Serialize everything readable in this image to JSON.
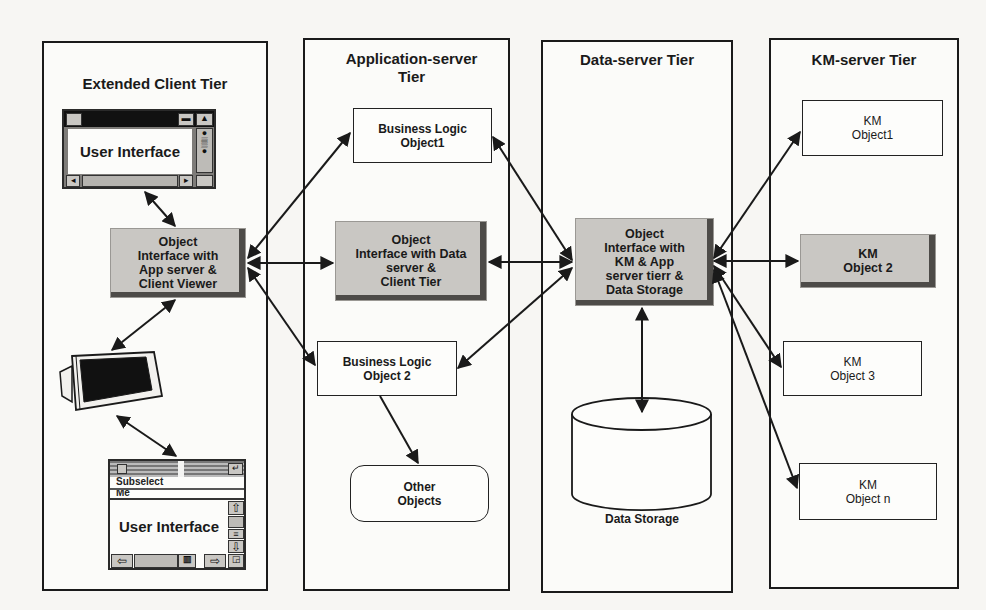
{
  "diagram": {
    "tiers": [
      {
        "id": "client",
        "title": "Extended Client Tier"
      },
      {
        "id": "app",
        "title": "Application-server\nTier"
      },
      {
        "id": "data",
        "title": "Data-server Tier"
      },
      {
        "id": "km",
        "title": "KM-server Tier"
      }
    ],
    "client": {
      "ui_top": {
        "label": "User Interface"
      },
      "object_interface": {
        "label": "Object\nInterface with\nApp server &\nClient Viewer"
      },
      "monitor": {
        "icon": "monitor-icon"
      },
      "ui_bottom": {
        "label": "User Interface",
        "menu_text": "Subselect\nMe"
      }
    },
    "app": {
      "business_logic_1": {
        "label": "Business Logic\nObject1"
      },
      "object_interface": {
        "label": "Object\nInterface with Data\nserver &\nClient Tier"
      },
      "business_logic_2": {
        "label": "Business Logic\nObject 2"
      },
      "other_objects": {
        "label": "Other\nObjects"
      }
    },
    "data": {
      "object_interface": {
        "label": "Object\nInterface with\nKM & App\nserver tierr &\nData Storage"
      },
      "storage": {
        "label": "Data Storage"
      }
    },
    "km": {
      "objects": [
        {
          "label": "KM\nObject1",
          "shaded": false
        },
        {
          "label": "KM\nObject 2",
          "shaded": true
        },
        {
          "label": "KM\nObject 3",
          "shaded": false
        },
        {
          "label": "KM\nObject n",
          "shaded": false
        }
      ]
    },
    "connections": [
      {
        "from": "client.ui_top",
        "to": "client.object_interface",
        "type": "bidirectional"
      },
      {
        "from": "client.object_interface",
        "to": "client.monitor",
        "type": "bidirectional"
      },
      {
        "from": "client.monitor",
        "to": "client.ui_bottom",
        "type": "bidirectional"
      },
      {
        "from": "client.object_interface",
        "to": "app.business_logic_1",
        "type": "bidirectional"
      },
      {
        "from": "client.object_interface",
        "to": "app.object_interface",
        "type": "bidirectional"
      },
      {
        "from": "client.object_interface",
        "to": "app.business_logic_2",
        "type": "bidirectional"
      },
      {
        "from": "app.business_logic_2",
        "to": "app.other_objects",
        "type": "directed"
      },
      {
        "from": "app.business_logic_1",
        "to": "data.object_interface",
        "type": "bidirectional"
      },
      {
        "from": "app.object_interface",
        "to": "data.object_interface",
        "type": "bidirectional"
      },
      {
        "from": "app.business_logic_2",
        "to": "data.object_interface",
        "type": "bidirectional"
      },
      {
        "from": "data.object_interface",
        "to": "data.storage",
        "type": "bidirectional"
      },
      {
        "from": "data.object_interface",
        "to": "km.objects.0",
        "type": "bidirectional"
      },
      {
        "from": "data.object_interface",
        "to": "km.objects.1",
        "type": "bidirectional"
      },
      {
        "from": "data.object_interface",
        "to": "km.objects.2",
        "type": "bidirectional"
      },
      {
        "from": "data.object_interface",
        "to": "km.objects.3",
        "type": "bidirectional"
      }
    ],
    "colors": {
      "line": "#1a1a1a",
      "shaded_fill": "#c9c7c3",
      "shaded_shadow": "#4d4b48",
      "background": "#f7f6f3"
    }
  }
}
